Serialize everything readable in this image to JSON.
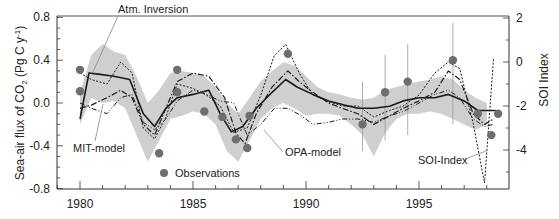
{
  "chart_data": {
    "type": "line",
    "title": "",
    "xlabel": "",
    "ylabel": "Sea-air flux of CO2 (Pg C y-1)",
    "ylabel_right": "SOI Index",
    "xlim": [
      1979,
      1999
    ],
    "ylim": [
      -0.8,
      0.8
    ],
    "ylim_right": [
      -6,
      2
    ],
    "x_ticks": [
      1980,
      1985,
      1990,
      1995
    ],
    "y_ticks": [
      "0.8",
      "0.4",
      "0.0",
      "-0.4",
      "-0.8"
    ],
    "y_ticks_right": [
      "2",
      "0",
      "-2",
      "-4"
    ],
    "grid": false,
    "annotations": [
      "Atm. Inversion",
      "MIT-model",
      "OPA-model",
      "SOI-Index",
      "Observations"
    ],
    "series": [
      {
        "name": "Atm. Inversion",
        "style": "solid",
        "x": [
          1980,
          1980.4,
          1980.8,
          1981.5,
          1982.2,
          1982.8,
          1983.3,
          1983.8,
          1984.3,
          1985.0,
          1985.7,
          1986.2,
          1986.7,
          1987.2,
          1987.8,
          1988.5,
          1989.1,
          1989.6,
          1990.3,
          1991.0,
          1991.7,
          1992.3,
          1993.0,
          1993.7,
          1994.3,
          1995.0,
          1995.7,
          1996.3,
          1997.0,
          1997.6,
          1998.0,
          1998.4
        ],
        "values": [
          -0.15,
          0.28,
          0.27,
          0.25,
          0.22,
          -0.1,
          -0.22,
          -0.05,
          0.05,
          0.08,
          0.12,
          -0.1,
          -0.27,
          -0.22,
          -0.05,
          0.1,
          0.22,
          0.15,
          0.08,
          0.02,
          -0.02,
          -0.05,
          -0.05,
          -0.03,
          0.02,
          0.05,
          0.05,
          0.08,
          0.02,
          -0.07,
          -0.07,
          -0.07
        ]
      },
      {
        "name": "MIT-model",
        "style": "dash-dot",
        "x": [
          1980,
          1980.5,
          1981.2,
          1981.8,
          1982.3,
          1982.8,
          1983.3,
          1983.8,
          1984.3,
          1985.0,
          1985.7,
          1986.4,
          1986.9,
          1987.3,
          1987.8,
          1988.5,
          1989.2,
          1989.7,
          1990.3,
          1991.0,
          1991.6,
          1992.3,
          1993.0,
          1993.7,
          1994.3,
          1995.0,
          1995.7,
          1996.3,
          1996.8,
          1997.4,
          1997.9,
          1998.3
        ],
        "values": [
          -0.05,
          -0.02,
          0.05,
          0.12,
          0.05,
          -0.2,
          -0.3,
          -0.05,
          0.2,
          0.28,
          0.25,
          0.05,
          -0.28,
          -0.38,
          -0.1,
          0.15,
          0.3,
          0.2,
          0.1,
          0.0,
          -0.05,
          -0.1,
          -0.2,
          -0.12,
          -0.05,
          0.02,
          0.1,
          0.3,
          0.22,
          -0.1,
          -0.2,
          -0.15
        ]
      },
      {
        "name": "OPA-model",
        "style": "dash-dot-dot",
        "x": [
          1980,
          1980.5,
          1981.2,
          1981.8,
          1982.3,
          1982.8,
          1983.3,
          1983.8,
          1984.3,
          1985.0,
          1985.6,
          1986.2,
          1986.8,
          1987.4,
          1988.0,
          1988.6,
          1989.2,
          1989.8,
          1990.3,
          1991.0,
          1991.6,
          1992.3,
          1993.0,
          1993.7,
          1994.3,
          1995.0,
          1995.7,
          1996.3,
          1996.8,
          1997.4,
          1997.9,
          1998.3
        ],
        "values": [
          0.0,
          -0.05,
          -0.1,
          0.05,
          0.08,
          -0.18,
          -0.25,
          -0.15,
          0.02,
          0.12,
          0.08,
          0.02,
          0.0,
          -0.3,
          -0.2,
          -0.05,
          -0.05,
          -0.12,
          -0.2,
          -0.18,
          -0.15,
          -0.15,
          -0.18,
          -0.12,
          -0.08,
          0.0,
          0.08,
          0.12,
          0.05,
          -0.15,
          -0.22,
          -0.2
        ]
      },
      {
        "name": "SOI-Index",
        "style": "dotted",
        "axis": "right",
        "x": [
          1980,
          1980.5,
          1981.2,
          1981.8,
          1982.3,
          1982.8,
          1983.3,
          1983.8,
          1984.3,
          1985.0,
          1985.6,
          1986.2,
          1986.8,
          1987.4,
          1988.0,
          1988.6,
          1989.1,
          1989.7,
          1990.3,
          1991.0,
          1991.6,
          1992.3,
          1993.0,
          1993.7,
          1994.3,
          1995.0,
          1995.7,
          1996.3,
          1996.8,
          1997.4,
          1997.9,
          1998.3
        ],
        "values": [
          -0.5,
          -0.8,
          -1.0,
          0.0,
          -0.5,
          -3.0,
          -3.5,
          -2.5,
          -1.0,
          -1.2,
          -1.5,
          -2.0,
          -3.2,
          -3.0,
          -1.5,
          0.3,
          0.8,
          -0.5,
          -1.5,
          -1.8,
          -2.0,
          -2.0,
          -2.5,
          -2.2,
          -2.0,
          -1.5,
          -0.5,
          0.0,
          -0.3,
          -2.8,
          -5.5,
          0.2
        ]
      },
      {
        "name": "Atm. Inversion uncertainty band",
        "style": "shaded",
        "x": [
          1980,
          1980.5,
          1981.0,
          1981.5,
          1982.0,
          1982.5,
          1983.0,
          1983.5,
          1984.0,
          1984.5,
          1985.0,
          1985.5,
          1986.0,
          1986.5,
          1987.0,
          1987.5,
          1988.0,
          1988.5,
          1989.0,
          1989.5,
          1990.0,
          1990.5,
          1991.0,
          1991.5,
          1992.0,
          1992.5,
          1993.0,
          1993.5,
          1994.0,
          1994.5,
          1995.0,
          1995.5,
          1996.0,
          1996.5,
          1997.0,
          1997.5,
          1998.0
        ],
        "upper": [
          0.1,
          0.45,
          0.55,
          0.48,
          0.45,
          0.25,
          0.0,
          0.12,
          0.28,
          0.3,
          0.28,
          0.25,
          0.15,
          0.0,
          -0.1,
          0.05,
          0.2,
          0.3,
          0.38,
          0.35,
          0.25,
          0.15,
          0.1,
          0.08,
          0.05,
          0.03,
          0.05,
          0.12,
          0.15,
          0.18,
          0.2,
          0.22,
          0.25,
          0.22,
          0.12,
          0.05,
          0.0
        ],
        "lower": [
          -0.2,
          0.05,
          0.0,
          0.02,
          -0.05,
          -0.3,
          -0.55,
          -0.35,
          -0.15,
          -0.12,
          -0.08,
          -0.1,
          -0.2,
          -0.45,
          -0.55,
          -0.35,
          -0.15,
          -0.05,
          0.0,
          -0.05,
          -0.12,
          -0.1,
          -0.1,
          -0.12,
          -0.2,
          -0.3,
          -0.5,
          -0.28,
          -0.15,
          -0.1,
          -0.1,
          -0.08,
          -0.1,
          -0.15,
          -0.2,
          -0.25,
          -0.2
        ]
      },
      {
        "name": "Observations",
        "style": "markers",
        "x": [
          1980.0,
          1980.0,
          1983.5,
          1984.3,
          1984.3,
          1985.5,
          1986.3,
          1986.9,
          1987.4,
          1987.5,
          1989.2,
          1992.5,
          1993.5,
          1994.5,
          1996.5,
          1997.6,
          1998.2,
          1998.5
        ],
        "values": [
          0.31,
          0.11,
          -0.47,
          0.31,
          0.1,
          -0.08,
          -0.13,
          -0.34,
          -0.42,
          -0.12,
          0.46,
          -0.2,
          0.1,
          0.2,
          0.4,
          -0.1,
          -0.3,
          -0.1
        ],
        "error_bars": [
          null,
          null,
          null,
          null,
          null,
          null,
          null,
          null,
          null,
          null,
          null,
          [
            -0.45,
            0.2
          ],
          [
            -0.35,
            0.45
          ],
          [
            -0.3,
            0.55
          ],
          [
            -0.2,
            0.75
          ],
          null,
          null,
          null
        ]
      }
    ]
  },
  "colors": {
    "axis": "#333333",
    "band": "#cfcfcf",
    "line": "#1a1a1a",
    "marker": "#6e6e6e",
    "annotation_leader": "#888888"
  }
}
